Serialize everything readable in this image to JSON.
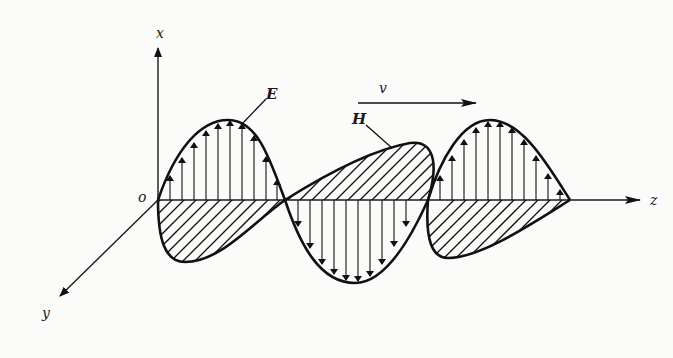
{
  "diagram": {
    "axes": {
      "x_label": "x",
      "y_label": "y",
      "z_label": "z",
      "origin_label": "o"
    },
    "labels": {
      "electric_field": "E",
      "magnetic_field": "H",
      "velocity": "v"
    },
    "colors": {
      "ink": "#111111",
      "background": "#fbfbf9"
    }
  }
}
